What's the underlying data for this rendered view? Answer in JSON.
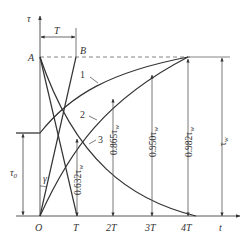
{
  "diagram": {
    "type": "thermal-time-constant-curves",
    "axes": {
      "y_label": "τ",
      "x_label": "t",
      "origin_label": "O"
    },
    "x_ticks": [
      "T",
      "2T",
      "3T",
      "4T"
    ],
    "points": {
      "A": "A",
      "B": "B"
    },
    "interval_label": "T",
    "curves": [
      {
        "id": "1",
        "label": "1",
        "description": "rise from initial τ0 toward τw"
      },
      {
        "id": "2",
        "label": "2",
        "description": "rise from 0 toward τw"
      },
      {
        "id": "3",
        "label": "3",
        "description": "decay from τw toward 0"
      }
    ],
    "angle_label": "γ",
    "initial_value_label": "τ0",
    "initial_value_sub": "0",
    "steady_label": "τw",
    "vertical_annotations": [
      {
        "at": "T",
        "text": "0.632τw"
      },
      {
        "at": "2T",
        "text": "0.865τw"
      },
      {
        "at": "3T",
        "text": "0.950τw"
      },
      {
        "at": "4T",
        "text": "0.982τw"
      }
    ],
    "steady_annotation": "τw"
  },
  "labels": {
    "tau": "τ",
    "t": "t",
    "O": "O",
    "A": "A",
    "B": "B",
    "T_top": "T",
    "c1": "1",
    "c2": "2",
    "c3": "3",
    "gamma": "γ",
    "tau0_main": "τ",
    "tau0_sub": "0",
    "tick_T": "T",
    "tick_2T": "2T",
    "tick_3T": "3T",
    "tick_4T": "4T",
    "v1_coef": "0.632τ",
    "v2_coef": "0.865τ",
    "v3_coef": "0.950τ",
    "v4_coef": "0.982τ",
    "w": "w",
    "tauw_main": "τ",
    "tauw_sub": "w"
  },
  "colors": {
    "line": "#333333",
    "thin": "#555555",
    "background": "#ffffff"
  }
}
